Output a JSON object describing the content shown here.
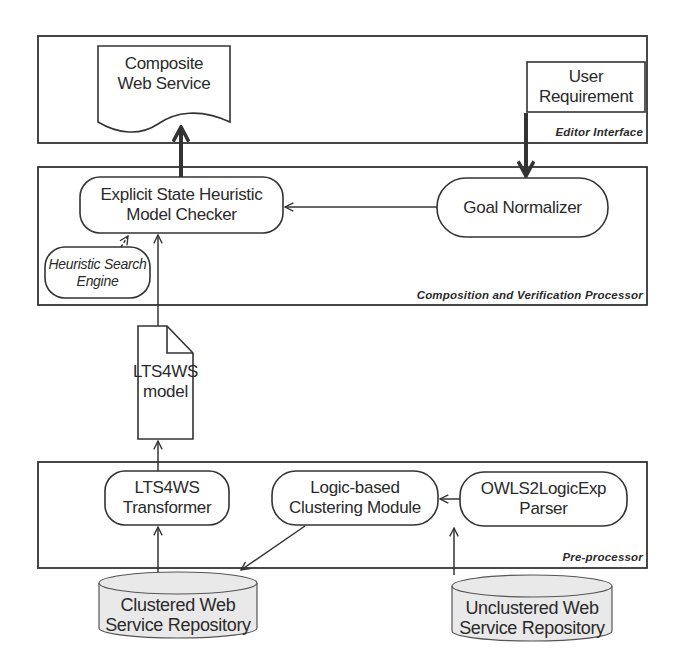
{
  "diagram": {
    "layers": {
      "editor": {
        "caption": "Editor Interface"
      },
      "processor": {
        "caption": "Composition and Verification Processor"
      },
      "preprocessor": {
        "caption": "Pre-processor"
      }
    },
    "nodes": {
      "composite": {
        "line1": "Composite",
        "line2": "Web Service"
      },
      "user_req": {
        "label": "User Requirement"
      },
      "model_checker": {
        "line1": "Explicit State Heuristic",
        "line2": "Model Checker"
      },
      "goal": {
        "label": "Goal Normalizer"
      },
      "hse": {
        "line1": "Heuristic Search",
        "line2": "Engine"
      },
      "lts_model": {
        "line1": "LTS4WS",
        "line2": "model"
      },
      "transformer": {
        "line1": "LTS4WS",
        "line2": "Transformer"
      },
      "clustering": {
        "line1": "Logic-based",
        "line2": "Clustering Module"
      },
      "parser": {
        "line1": "OWLS2LogicExp",
        "line2": "Parser"
      },
      "clustered_repo": {
        "line1": "Clustered Web",
        "line2": "Service Repository"
      },
      "unclustered_repo": {
        "line1": "Unclustered Web",
        "line2": "Service Repository"
      }
    },
    "colors": {
      "stroke": "#333333",
      "repo_fill": "#e9e9e9",
      "background": "#ffffff"
    }
  }
}
